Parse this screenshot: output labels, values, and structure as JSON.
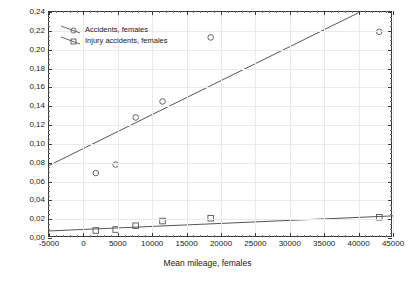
{
  "chart_data": {
    "type": "scatter",
    "title": "",
    "xlabel": "Mean mileage, females",
    "ylabel": "",
    "xlim": [
      -5000,
      45000
    ],
    "ylim": [
      0.0,
      0.24
    ],
    "xticks": [
      -5000,
      0,
      5000,
      10000,
      15000,
      20000,
      25000,
      30000,
      35000,
      40000,
      45000
    ],
    "xtick_labels": [
      "-5000",
      "0",
      "5000",
      "10000",
      "15000",
      "20000",
      "25000",
      "30000",
      "35000",
      "40000",
      "45000"
    ],
    "yticks": [
      0.0,
      0.02,
      0.04,
      0.06,
      0.08,
      0.1,
      0.12,
      0.14,
      0.16,
      0.18,
      0.2,
      0.22,
      0.24
    ],
    "ytick_labels": [
      "0,00",
      "0,02",
      "0,04",
      "0,06",
      "0,08",
      "0,10",
      "0,12",
      "0,14",
      "0,16",
      "0,18",
      "0,20",
      "0,22",
      "0,24"
    ],
    "decimal_separator": ",",
    "grid": true,
    "legend_position": "top-left",
    "series": [
      {
        "name": "Accidents, females",
        "marker": "circle",
        "color": "#555555",
        "points": [
          {
            "x": 1800,
            "y": 0.069
          },
          {
            "x": 4700,
            "y": 0.078
          },
          {
            "x": 7600,
            "y": 0.128
          },
          {
            "x": 11500,
            "y": 0.145
          },
          {
            "x": 18500,
            "y": 0.213
          },
          {
            "x": 43000,
            "y": 0.219
          }
        ],
        "fit_line": {
          "x0": -5000,
          "y0": 0.077,
          "x1": 40200,
          "y1": 0.24
        }
      },
      {
        "name": "Injury accidents, females",
        "marker": "square",
        "color": "#555555",
        "points": [
          {
            "x": 1800,
            "y": 0.008
          },
          {
            "x": 4700,
            "y": 0.009
          },
          {
            "x": 7600,
            "y": 0.013
          },
          {
            "x": 11500,
            "y": 0.018
          },
          {
            "x": 18500,
            "y": 0.021
          },
          {
            "x": 43000,
            "y": 0.022
          }
        ],
        "fit_line": {
          "x0": -5000,
          "y0": 0.0075,
          "x1": 45000,
          "y1": 0.0235
        }
      }
    ]
  }
}
